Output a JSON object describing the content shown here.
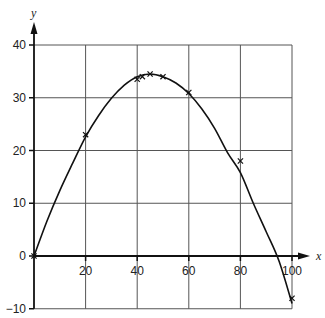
{
  "chart_data": {
    "type": "line",
    "title": "",
    "xlabel": "x",
    "ylabel": "y",
    "xlim": [
      0,
      100
    ],
    "ylim": [
      -10,
      40
    ],
    "grid": true,
    "legend": null,
    "x_ticks": [
      20,
      40,
      60,
      80,
      100
    ],
    "y_ticks": [
      -10,
      0,
      10,
      20,
      30,
      40
    ],
    "x_tick_labels": [
      "20",
      "40",
      "60",
      "80",
      "100"
    ],
    "y_tick_labels": [
      "−10",
      "0",
      "10",
      "20",
      "30",
      "40"
    ],
    "series": [
      {
        "name": "measured points",
        "marker": "x",
        "x": [
          0,
          20,
          40,
          42,
          45,
          50,
          60,
          80,
          100
        ],
        "y": [
          0,
          23,
          33.5,
          34,
          34.5,
          34,
          31,
          18,
          -8
        ]
      },
      {
        "name": "fitted curve",
        "style": "smooth line",
        "x": [
          0,
          5,
          10,
          15,
          20,
          25,
          30,
          35,
          40,
          45,
          50,
          55,
          60,
          65,
          70,
          75,
          80,
          85,
          90,
          95,
          100
        ],
        "y": [
          0,
          6.6,
          12.4,
          17.6,
          22.6,
          26.6,
          29.9,
          32.4,
          34.0,
          34.5,
          34.0,
          32.8,
          30.8,
          27.9,
          24.2,
          19.6,
          15.8,
          10.0,
          4.6,
          -1.0,
          -9.0
        ]
      }
    ]
  }
}
